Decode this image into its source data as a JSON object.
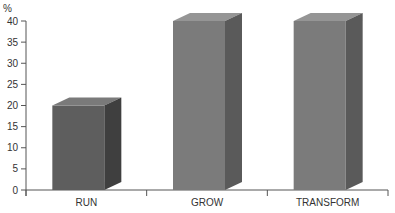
{
  "chart_data": {
    "type": "bar",
    "title": "",
    "xlabel": "",
    "ylabel": "%",
    "categories": [
      "RUN",
      "GROW",
      "TRANSFORM"
    ],
    "values": [
      20,
      40,
      40
    ],
    "ylim": [
      0,
      40
    ],
    "yticks": [
      0,
      5,
      10,
      15,
      20,
      25,
      30,
      35,
      40
    ],
    "grid": false,
    "legend": null,
    "style": "3d-bar",
    "colors": {
      "RUN": {
        "front": "#5e5e5e",
        "top": "#7a7a7a",
        "side": "#3f3f3f"
      },
      "GROW": {
        "front": "#7b7b7b",
        "top": "#959595",
        "side": "#5a5a5a"
      },
      "TRANSFORM": {
        "front": "#7b7b7b",
        "top": "#959595",
        "side": "#5a5a5a"
      }
    }
  }
}
